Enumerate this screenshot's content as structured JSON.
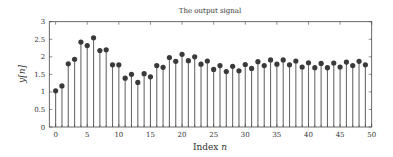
{
  "chart_data": {
    "type": "stem",
    "title": "The output signal",
    "xlabel": "Index n",
    "xlabel_text": "Index ",
    "xlabel_var": "n",
    "ylabel": "y[n]",
    "xlim": [
      -1,
      50
    ],
    "ylim": [
      0,
      3
    ],
    "grid": false,
    "legend": null,
    "x_ticks": [
      0,
      5,
      10,
      15,
      20,
      25,
      30,
      35,
      40,
      45,
      50
    ],
    "y_ticks": [
      0,
      0.5,
      1,
      1.5,
      2,
      2.5,
      3
    ],
    "y_tick_labels": [
      "0",
      "0.5",
      "1",
      "1.5",
      "2",
      "2.5",
      "3"
    ],
    "x": [
      0,
      1,
      2,
      3,
      4,
      5,
      6,
      7,
      8,
      9,
      10,
      11,
      12,
      13,
      14,
      15,
      16,
      17,
      18,
      19,
      20,
      21,
      22,
      23,
      24,
      25,
      26,
      27,
      28,
      29,
      30,
      31,
      32,
      33,
      34,
      35,
      36,
      37,
      38,
      39,
      40,
      41,
      42,
      43,
      44,
      45,
      46,
      47,
      48,
      49
    ],
    "values": [
      1.03,
      1.17,
      1.8,
      1.93,
      2.42,
      2.32,
      2.54,
      2.18,
      2.2,
      1.77,
      1.77,
      1.39,
      1.5,
      1.27,
      1.52,
      1.43,
      1.75,
      1.7,
      1.98,
      1.87,
      2.07,
      1.89,
      2.0,
      1.79,
      1.88,
      1.64,
      1.75,
      1.58,
      1.73,
      1.6,
      1.78,
      1.67,
      1.86,
      1.75,
      1.91,
      1.79,
      1.91,
      1.77,
      1.88,
      1.71,
      1.83,
      1.69,
      1.81,
      1.69,
      1.82,
      1.71,
      1.85,
      1.75,
      1.87,
      1.77
    ],
    "colors": {
      "stem": "#6b6b6b",
      "marker": "#3a3a3a",
      "axis": "#444444"
    }
  }
}
